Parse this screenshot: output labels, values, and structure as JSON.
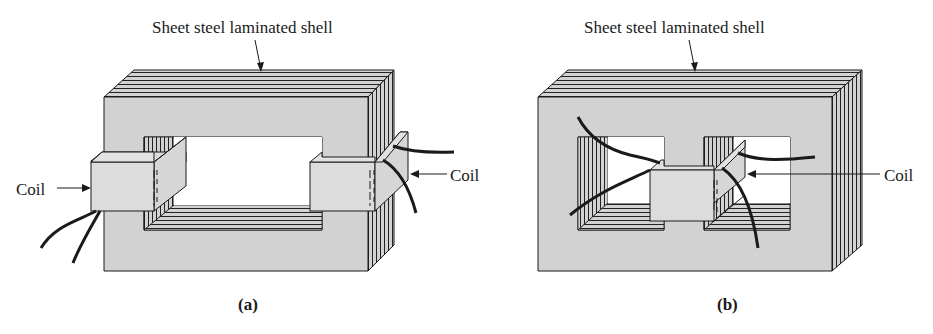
{
  "figure": {
    "panels": [
      {
        "id": "a",
        "caption": "(a)",
        "title_label": "Sheet steel laminated shell",
        "coil_labels": [
          "Coil",
          "Coil"
        ],
        "description": "Core-type transformer: rectangular laminated core with a coil on each leg"
      },
      {
        "id": "b",
        "caption": "(b)",
        "title_label": "Sheet steel laminated shell",
        "coil_labels": [
          "Coil"
        ],
        "description": "Shell-type transformer: laminated shell with two windows and a single coil on the center leg"
      }
    ]
  },
  "colors": {
    "steel_face": "#d2d2d2",
    "coil_face": "#dcdcdc",
    "outline": "#1a1a1a",
    "window": "#ffffff"
  }
}
